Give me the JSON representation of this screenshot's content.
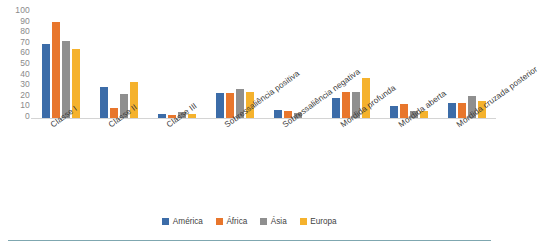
{
  "chart_data": {
    "type": "bar",
    "title": "",
    "subtitle": "",
    "xlabel": "",
    "ylabel": "",
    "ylim": [
      0,
      100
    ],
    "yticks": [
      0,
      10,
      20,
      30,
      40,
      50,
      60,
      70,
      80,
      90,
      100
    ],
    "grid": false,
    "legend_position": "bottom",
    "categories": [
      "Classe I",
      "Classe II",
      "Classe III",
      "Sobressaliência positiva",
      "Sobressaliência negativa",
      "Mordida profunda",
      "Mordida aberta",
      "Mordida cruzada posterior"
    ],
    "series": [
      {
        "name": "América",
        "color": "#3c6ca8",
        "values": [
          70,
          29,
          4,
          24,
          8,
          19,
          11,
          14
        ]
      },
      {
        "name": "África",
        "color": "#e8762c",
        "values": [
          91,
          9,
          3,
          24,
          7,
          25,
          13,
          14
        ]
      },
      {
        "name": "Ásia",
        "color": "#8f8f8f",
        "values": [
          73,
          23,
          6,
          27,
          5,
          25,
          7,
          21
        ]
      },
      {
        "name": "Europa",
        "color": "#f5b22d",
        "values": [
          65,
          34,
          4,
          25,
          0,
          38,
          7,
          16
        ]
      }
    ]
  },
  "axis": {
    "y_tick_labels": [
      "100",
      "90",
      "80",
      "70",
      "60",
      "50",
      "40",
      "30",
      "20",
      "10",
      "0"
    ]
  },
  "colors": {
    "america": "#3c6ca8",
    "africa": "#e8762c",
    "asia": "#8f8f8f",
    "europa": "#f5b22d",
    "baseline": "#d4d4d4",
    "rule": "#7fa7b0",
    "tick_text": "#8a8a8a",
    "label_text": "#3b3b3b"
  }
}
